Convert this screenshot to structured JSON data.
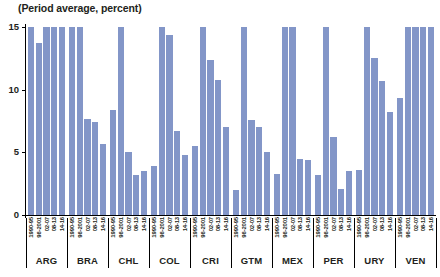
{
  "chart_data": {
    "type": "bar",
    "title": "(Period average, percent)",
    "xlabel": "",
    "ylabel": "",
    "ylim": [
      0,
      15
    ],
    "yticks": [
      0,
      5,
      10,
      15
    ],
    "ytick_labels": [
      "0",
      "5",
      "10",
      "15"
    ],
    "grid": false,
    "legend": "none",
    "bar_color": "#8396c8",
    "note": "Bars are clipped at the axis maximum of 15; values at 15 indicate values at or above 15 percent.",
    "categories": [
      "1990-95",
      "96-2001",
      "02-07",
      "08-13",
      "14-16"
    ],
    "groups": [
      {
        "code": "ARG",
        "values": [
          15,
          13.7,
          15,
          15,
          15
        ]
      },
      {
        "code": "BRA",
        "values": [
          15,
          15,
          7.7,
          7.4,
          5.7
        ]
      },
      {
        "code": "CHL",
        "values": [
          8.4,
          15,
          5.0,
          3.2,
          3.5
        ]
      },
      {
        "code": "COL",
        "values": [
          3.9,
          15,
          14.4,
          6.7,
          4.8
        ]
      },
      {
        "code": "CRI",
        "values": [
          5.5,
          15,
          12.4,
          10.8,
          7.0
        ]
      },
      {
        "code": "GTM",
        "values": [
          2.0,
          15,
          7.6,
          7.0,
          5.0
        ]
      },
      {
        "code": "MEX",
        "values": [
          3.3,
          15,
          15,
          4.5,
          4.4
        ]
      },
      {
        "code": "PER",
        "values": [
          3.2,
          15,
          6.2,
          2.1,
          3.5
        ]
      },
      {
        "code": "URY",
        "values": [
          3.6,
          15,
          12.5,
          10.7,
          8.2
        ]
      },
      {
        "code": "VEN",
        "values": [
          9.3,
          15,
          15,
          15,
          15
        ]
      }
    ]
  }
}
